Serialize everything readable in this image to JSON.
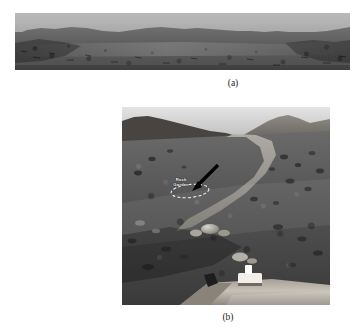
{
  "figure": {
    "background_color": "#ffffff",
    "panels": [
      {
        "id": "a",
        "caption": "(a)",
        "kind": "panoramic-terrain-photograph",
        "description": "Wide, low-height grayscale panoramic image of a barren rocky plain with a light gray sky band above an undulating dark ridgeline horizon.",
        "annotations": []
      },
      {
        "id": "b",
        "caption": "(b)",
        "kind": "rover-surface-photograph",
        "description": "Square grayscale surface image taken from a planetary rover: rocky regolith slope in the foreground, a light sandy channel running up the middle toward a hill on the right, bright sky at the upper right, and part of the rover's solar deck with a bright instrument fixture visible at the bottom.",
        "annotations": [
          {
            "type": "arrow",
            "name": "rock-garden-arrow",
            "direction": "down-left",
            "color": "#000000"
          },
          {
            "type": "ellipse-outline",
            "name": "rock-garden-ellipse",
            "color": "#ffffff",
            "style": "dashed"
          },
          {
            "type": "text-label",
            "name": "rock-garden-label",
            "lines": [
              "Rock",
              "Garden"
            ],
            "color": "#ffffff"
          }
        ]
      }
    ]
  },
  "colors": {
    "page_background": "#ffffff",
    "panel_a_sky": "#b4b4b4",
    "panel_a_terrain": "#5e5e5e",
    "panel_b_sky": "#d8d8d8",
    "panel_b_soil_light": "#9a9a9a",
    "panel_b_soil_dark": "#3a3a3a",
    "panel_b_deck": "#c9c4bc",
    "annotation_text": "#ffffff",
    "arrow": "#000000",
    "caption_text": "#1b1b1b"
  }
}
